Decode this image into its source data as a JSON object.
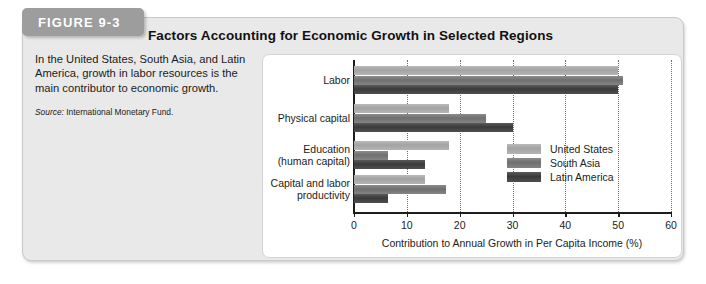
{
  "figure": {
    "tag": "FIGURE 9-3",
    "headline": "Factors Accounting for Economic Growth in Selected Regions",
    "caption": "In the United States, South Asia, and Latin America, growth in labor resources is the main contributor to economic growth.",
    "source_lead": "Source:",
    "source_text": " International Monetary Fund."
  },
  "chart_data": {
    "type": "bar",
    "orientation": "horizontal",
    "grouped": true,
    "title": "Factors Accounting for Economic Growth in Selected Regions",
    "xlabel": "Contribution to Annual Growth in Per Capita Income (%)",
    "ylabel": "",
    "xlim": [
      0,
      60
    ],
    "xticks": [
      0,
      10,
      20,
      30,
      40,
      50,
      60
    ],
    "xticklabels": [
      "0",
      "10",
      "20",
      "30",
      "40",
      "50",
      "60"
    ],
    "grid": "vertical-dotted",
    "legend_position": "center-right-inside",
    "categories": [
      "Labor",
      "Physical capital",
      "Education\n(human capital)",
      "Capital and labor\nproductivity"
    ],
    "category_lines": [
      [
        "Labor"
      ],
      [
        "Physical capital"
      ],
      [
        "Education",
        "(human capital)"
      ],
      [
        "Capital and labor",
        "productivity"
      ]
    ],
    "series": [
      {
        "name": "United States",
        "color": "#ababab",
        "values": [
          50,
          18,
          18,
          13.5
        ]
      },
      {
        "name": "South Asia",
        "color": "#777777",
        "values": [
          51,
          25,
          6.5,
          17.5
        ]
      },
      {
        "name": "Latin America",
        "color": "#434343",
        "values": [
          50,
          30,
          13.5,
          6.5
        ]
      }
    ]
  }
}
